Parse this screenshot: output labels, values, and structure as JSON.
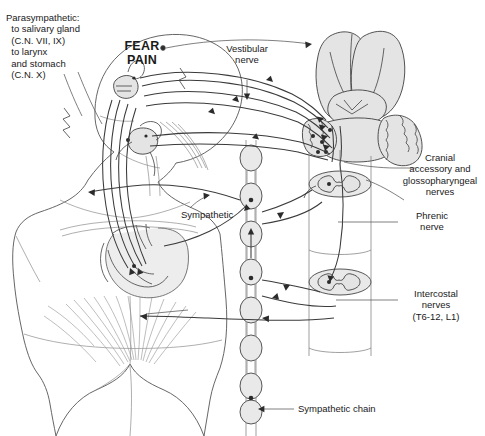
{
  "figure": {
    "background_color": "#ffffff",
    "ink_color": "#1a1a1a",
    "organ_fill_color": "#e9e9e9"
  },
  "labels": {
    "parasympathetic": {
      "name": "parasympathetic-label",
      "lines": [
        "Parasympathetic:",
        "  to salivary gland",
        "  (C.N. VII, IX)",
        "  to larynx",
        "  and stomach",
        "  (C.N. X)"
      ],
      "text": "Parasympathetic:\n  to salivary gland\n  (C.N. VII, IX)\n  to larynx\n  and stomach\n  (C.N. X)"
    },
    "fear_pain": {
      "name": "fear-pain-label",
      "lines": [
        "FEAR",
        "PAIN"
      ],
      "text": "FEAR\nPAIN"
    },
    "vestibular": {
      "name": "vestibular-nerve-label",
      "lines": [
        "Vestibular",
        "nerve"
      ],
      "text": "Vestibular\nnerve"
    },
    "cranial": {
      "name": "cranial-accessory-glossopharyngeal-label",
      "lines": [
        "Cranial",
        "accessory and",
        "glossopharyngeal",
        "nerves"
      ],
      "text": "Cranial\naccessory and\nglossopharyngeal\nnerves"
    },
    "phrenic": {
      "name": "phrenic-nerve-label",
      "lines": [
        "Phrenic",
        "nerve"
      ],
      "text": "Phrenic\nnerve"
    },
    "intercostal": {
      "name": "intercostal-nerves-label",
      "lines": [
        "Intercostal",
        "nerves",
        "(T6-12, L1)"
      ],
      "text": "Intercostal\nnerves\n(T6-12, L1)"
    },
    "sympathetic": {
      "name": "sympathetic-label",
      "text": "Sympathetic"
    },
    "sympathetic_chain": {
      "name": "sympathetic-chain-label",
      "text": "Sympathetic chain"
    }
  },
  "structures": [
    {
      "name": "human-torso-silhouette",
      "description": "Anterior view of head, neck, shoulders, trunk and pelvis"
    },
    {
      "name": "brain-cerebral-hemispheres",
      "description": "Paired cerebral hemispheres, top right"
    },
    {
      "name": "brainstem-cerebellum",
      "description": "Brainstem with cerebellum and medulla, right"
    },
    {
      "name": "spinal-cord-cross-section-upper",
      "description": "Cervical/thoracic cord cylinder with butterfly gray matter"
    },
    {
      "name": "spinal-cord-cross-section-lower",
      "description": "Lower thoracic cord cylinder with butterfly gray matter"
    },
    {
      "name": "sympathetic-chain-ganglia",
      "description": "Beaded paravertebral ganglion chain running vertically"
    },
    {
      "name": "stomach",
      "description": "Stomach in upper abdomen"
    },
    {
      "name": "salivary-gland",
      "description": "Salivary gland near the jaw"
    },
    {
      "name": "larynx-pharynx",
      "description": "Larynx / pharyngeal structures in the neck"
    },
    {
      "name": "abdominal-muscles",
      "description": "Fanned abdominal wall musculature"
    },
    {
      "name": "nerve-pathway-bundle",
      "description": "Long afferent and efferent nerve tracts between brainstem, cord and viscera"
    }
  ]
}
